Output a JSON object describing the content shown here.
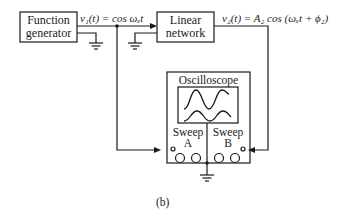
{
  "diagram": {
    "blocks": [
      {
        "id": "function-generator",
        "label_line1": "Function",
        "label_line2": "generator"
      },
      {
        "id": "linear-network",
        "label_line1": "Linear",
        "label_line2": "network"
      }
    ],
    "signals": {
      "input": "v₁(t) = cos ωₓt",
      "output": "v₂(t) = A₂ cos (ωₓt + ϕ₂)"
    },
    "oscilloscope": {
      "title": "Oscilloscope",
      "channel_a": {
        "line1": "Sweep",
        "line2": "A"
      },
      "channel_b": {
        "line1": "Sweep",
        "line2": "B"
      }
    },
    "caption": "(b)"
  }
}
